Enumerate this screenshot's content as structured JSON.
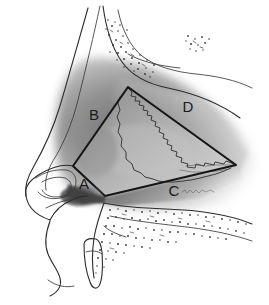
{
  "figure": {
    "type": "medical-illustration",
    "view": "sagittal lateral profile of nose",
    "width": 269,
    "height": 305,
    "background_color": "#ffffff"
  },
  "labels": [
    {
      "id": "A",
      "text": "A",
      "x": 84,
      "y": 189,
      "description": "caudal septal angle / anterior inferior corner of graft"
    },
    {
      "id": "B",
      "text": "B",
      "x": 94,
      "y": 120,
      "description": "dorsal septal border / anterior superior edge of graft"
    },
    {
      "id": "C",
      "text": "C",
      "x": 174,
      "y": 196,
      "description": "inferior septal border along maxillary crest"
    },
    {
      "id": "D",
      "text": "D",
      "x": 188,
      "y": 112,
      "description": "posterior superior region of quadrangular cartilage"
    }
  ],
  "annotations": {
    "signature": {
      "text": "illustration signature",
      "x": 187,
      "y": 192,
      "legible": false
    }
  },
  "graft_polygon": {
    "description": "quadrilateral cartilage harvest outline",
    "vertices": [
      {
        "x": 73,
        "y": 166
      },
      {
        "x": 128,
        "y": 87
      },
      {
        "x": 236,
        "y": 165
      },
      {
        "x": 105,
        "y": 196
      }
    ],
    "stroke_color": "#161616",
    "stroke_width": 2.1
  },
  "shading": {
    "cartilage_fill_light": "#d8d8d8",
    "cartilage_fill_mid": "#9a9a9a",
    "cartilage_fill_dark": "#6e6e6e",
    "shadow_color": "#4a4a4a",
    "outline_color": "#2b2b2b"
  },
  "anatomy_regions": [
    {
      "name": "nasal-dorsum-profile",
      "interactable": false
    },
    {
      "name": "nasal-tip",
      "interactable": false
    },
    {
      "name": "alar-cartilage",
      "interactable": false
    },
    {
      "name": "columella",
      "interactable": false
    },
    {
      "name": "upper-lip",
      "interactable": false
    },
    {
      "name": "maxillary-bone-stipple",
      "interactable": false
    },
    {
      "name": "nasal-bone-stipple",
      "interactable": false
    },
    {
      "name": "incisor-tooth",
      "interactable": false
    },
    {
      "name": "quadrangular-cartilage",
      "interactable": false
    },
    {
      "name": "perpendicular-plate",
      "interactable": false
    }
  ]
}
